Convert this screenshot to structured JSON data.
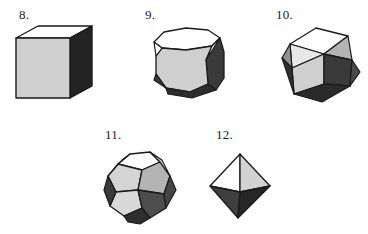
{
  "page": {
    "background_color": "#ffffff",
    "width": 368,
    "height": 234
  },
  "palette": {
    "outline": "#1a1a1a",
    "face_white": "#ffffff",
    "face_light": "#cfcfcf",
    "face_mid": "#b4b4b4",
    "face_dark": "#3a3a3a",
    "face_black": "#232323",
    "label_color": "#1a1a1a"
  },
  "figures": [
    {
      "id": "fig8",
      "label": "8.",
      "shape_name": "cube",
      "faces": {
        "top": "face_white",
        "front": "face_light",
        "right": "face_black"
      }
    },
    {
      "id": "fig9",
      "label": "9.",
      "shape_name": "truncated-cube",
      "faces": {
        "top": "face_white",
        "front": "face_light",
        "right": "face_dark",
        "corner_triangles": "face_white"
      }
    },
    {
      "id": "fig10",
      "label": "10.",
      "shape_name": "cuboctahedron",
      "faces": {
        "top": "face_white",
        "front_square": "face_light",
        "right_square": "face_dark",
        "triangles": "face_mid"
      }
    },
    {
      "id": "fig11",
      "label": "11.",
      "shape_name": "dodecahedron",
      "faces": {
        "top": "face_white",
        "upper_left": "face_light",
        "upper_right": "face_mid",
        "lower": "face_dark"
      }
    },
    {
      "id": "fig12",
      "label": "12.",
      "shape_name": "octahedron",
      "faces": {
        "upper_left": "face_white",
        "upper_right": "face_light",
        "lower_left": "face_dark",
        "lower_right": "face_black"
      }
    }
  ]
}
